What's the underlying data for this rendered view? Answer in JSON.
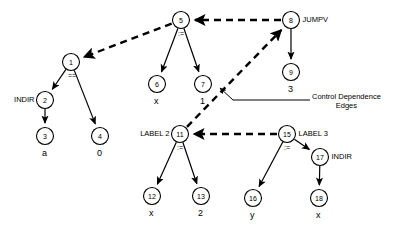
{
  "diagram": {
    "colors": {
      "ink": "#000000",
      "paper": "#ffffff"
    },
    "annotation": {
      "line1": "Control Dependence",
      "line2": "Edges"
    },
    "nodes": [
      {
        "id": "n1",
        "num": "1",
        "cx": 71,
        "cy": 62,
        "r": 8.5,
        "side_label": "",
        "op_label": "==",
        "value_label": ""
      },
      {
        "id": "n2",
        "num": "2",
        "cx": 45,
        "cy": 100,
        "r": 8.5,
        "side_label": "INDIR",
        "op_label": "",
        "value_label": ""
      },
      {
        "id": "n3",
        "num": "3",
        "cx": 45,
        "cy": 136,
        "r": 8.5,
        "side_label": "",
        "op_label": "",
        "value_label": "a"
      },
      {
        "id": "n4",
        "num": "4",
        "cx": 100,
        "cy": 136,
        "r": 8.5,
        "side_label": "",
        "op_label": "",
        "value_label": "0"
      },
      {
        "id": "n5",
        "num": "5",
        "cx": 181,
        "cy": 20,
        "r": 8.5,
        "side_label": "",
        "op_label": ":=",
        "value_label": ""
      },
      {
        "id": "n6",
        "num": "6",
        "cx": 157,
        "cy": 84,
        "r": 8.5,
        "side_label": "",
        "op_label": "",
        "value_label": "x"
      },
      {
        "id": "n7",
        "num": "7",
        "cx": 203,
        "cy": 84,
        "r": 8.5,
        "side_label": "",
        "op_label": "",
        "value_label": "1"
      },
      {
        "id": "n8",
        "num": "8",
        "cx": 291,
        "cy": 20,
        "r": 8.5,
        "side_label": "JUMPV",
        "op_label": "",
        "value_label": ""
      },
      {
        "id": "n9",
        "num": "9",
        "cx": 291,
        "cy": 72,
        "r": 8.5,
        "side_label": "",
        "op_label": "",
        "value_label": "3"
      },
      {
        "id": "n11",
        "num": "11",
        "cx": 180,
        "cy": 134,
        "r": 8.5,
        "side_label": "LABEL 2",
        "op_label": ":=",
        "value_label": ""
      },
      {
        "id": "n12",
        "num": "12",
        "cx": 152,
        "cy": 196,
        "r": 8.5,
        "side_label": "",
        "op_label": "",
        "value_label": "x"
      },
      {
        "id": "n13",
        "num": "13",
        "cx": 201,
        "cy": 196,
        "r": 8.5,
        "side_label": "",
        "op_label": "",
        "value_label": "2"
      },
      {
        "id": "n15",
        "num": "15",
        "cx": 287,
        "cy": 134,
        "r": 8.5,
        "side_label": "LABEL 3",
        "op_label": ":=",
        "value_label": ""
      },
      {
        "id": "n16",
        "num": "16",
        "cx": 253,
        "cy": 198,
        "r": 8.5,
        "side_label": "",
        "op_label": "",
        "value_label": "y"
      },
      {
        "id": "n17",
        "num": "17",
        "cx": 320,
        "cy": 157,
        "r": 8.5,
        "side_label": "INDIR",
        "op_label": "",
        "value_label": ""
      },
      {
        "id": "n18",
        "num": "18",
        "cx": 319,
        "cy": 198,
        "r": 8.5,
        "side_label": "",
        "op_label": "",
        "value_label": "x"
      }
    ],
    "solid_edges": [
      {
        "from": "n1",
        "to": "n2"
      },
      {
        "from": "n1",
        "to": "n4"
      },
      {
        "from": "n2",
        "to": "n3"
      },
      {
        "from": "n5",
        "to": "n6"
      },
      {
        "from": "n5",
        "to": "n7"
      },
      {
        "from": "n8",
        "to": "n9"
      },
      {
        "from": "n11",
        "to": "n12"
      },
      {
        "from": "n11",
        "to": "n13"
      },
      {
        "from": "n15",
        "to": "n16"
      },
      {
        "from": "n15",
        "to": "n17"
      },
      {
        "from": "n17",
        "to": "n18"
      }
    ],
    "dashed_edges": [
      {
        "from": "n5",
        "to": "n1",
        "kind": "control-dependence"
      },
      {
        "from": "n8",
        "to": "n5",
        "kind": "control-dependence"
      },
      {
        "from": "n11",
        "to": "n8",
        "kind": "control-dependence"
      },
      {
        "from": "n15",
        "to": "n11",
        "kind": "control-dependence"
      }
    ]
  }
}
